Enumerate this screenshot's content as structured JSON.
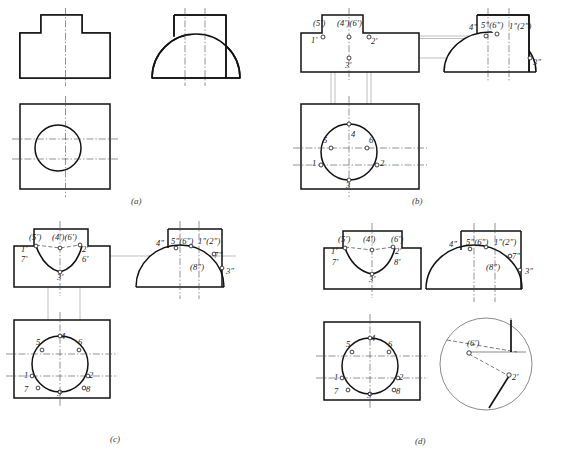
{
  "figure": {
    "panel_captions": [
      "(a)",
      "(b)",
      "(c)",
      "(d)"
    ]
  },
  "panels": {
    "a": {
      "caption": "(a)",
      "description": "Three given views: front view with stepped outline, side view semicircle with rectangular boss, top view rectangle with circle",
      "labels": []
    },
    "b": {
      "caption": "(b)",
      "description": "Step 1 - locate points 1,2,3,4,5,6 in top view and project to front and side views",
      "front_labels": [
        "(5')",
        "(4')(6')",
        "1'",
        "2'",
        "3'"
      ],
      "side_labels": [
        "4\"",
        "5\"(6\")",
        "1\"(2\")",
        "3\""
      ],
      "top_labels": [
        "5",
        "4",
        "6",
        "1",
        "2",
        "3"
      ]
    },
    "c": {
      "caption": "(c)",
      "description": "Step 2 - add points 7 and 8, draw intersection curve in front view",
      "front_labels": [
        "(5')",
        "(4')(6')",
        "1'",
        "7'",
        "2'",
        "6'",
        "3'"
      ],
      "side_labels": [
        "4\"",
        "5\"(6\")",
        "1\"(2\")",
        "7\"",
        "(8\")",
        "3\""
      ],
      "top_labels": [
        "5",
        "4",
        "6",
        "1",
        "2",
        "7",
        "3",
        "8"
      ]
    },
    "d": {
      "caption": "(d)",
      "description": "Step 3 - completed views with smooth intersection curve plus enlarged detail of point 2' and (6')",
      "front_labels": [
        "(5')",
        "(4')",
        "(6')",
        "1'",
        "7'",
        "2'",
        "8'",
        "3'"
      ],
      "side_labels": [
        "4\"",
        "5\"(6\")",
        "1\"(2\")",
        "7\"",
        "(8\")",
        "3\""
      ],
      "top_labels": [
        "5",
        "4",
        "6",
        "1",
        "2",
        "7",
        "3",
        "8"
      ],
      "detail_labels": [
        "(6')",
        "2'"
      ]
    }
  },
  "colors": {
    "outline": "#111111",
    "center_line": "#4a4a4a",
    "projection_line": "#8a8a8a",
    "hidden_line": "#444444",
    "background": "#ffffff"
  }
}
